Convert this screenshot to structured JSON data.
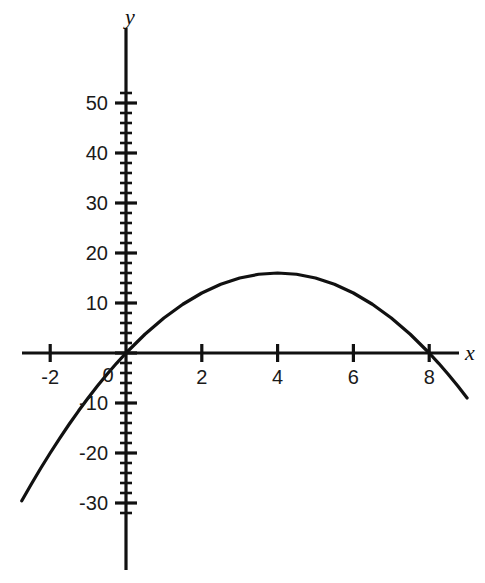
{
  "chart_data": {
    "type": "line",
    "title": "",
    "subtitle": "",
    "xlabel": "x",
    "ylabel": "y",
    "equation": "y = -x^2 + 8x",
    "grid": false,
    "legend": false,
    "xlim": [
      -3.2,
      9.4
    ],
    "ylim": [
      -34,
      53
    ],
    "x_major_ticks": [
      -2,
      0,
      2,
      4,
      6,
      8
    ],
    "x_tick_labels": [
      "-2",
      "0",
      "2",
      "4",
      "6",
      "8"
    ],
    "x_tick_step": 2,
    "x_minor_step": 0,
    "y_major_ticks": [
      -30,
      -20,
      -10,
      0,
      10,
      20,
      30,
      40,
      50
    ],
    "y_tick_labels": [
      "-30",
      "-20",
      "-10",
      "0",
      "10",
      "20",
      "30",
      "40",
      "50"
    ],
    "y_tick_step": 10,
    "y_minor_step": 2,
    "zero_label_shown": "0",
    "roots": [
      0,
      8
    ],
    "vertex": [
      4,
      16
    ],
    "series": [
      {
        "name": "parabola",
        "color": "#111111",
        "x": [
          -2.75,
          -2.5,
          -2.25,
          -2,
          -1.75,
          -1.5,
          -1.25,
          -1,
          -0.75,
          -0.5,
          -0.25,
          0,
          0.5,
          1,
          1.5,
          2,
          2.5,
          3,
          3.5,
          4,
          4.5,
          5,
          5.5,
          6,
          6.5,
          7,
          7.5,
          8,
          8.25,
          8.5,
          8.75,
          9
        ],
        "y": [
          -29.56,
          -26.25,
          -23.06,
          -20,
          -17.06,
          -14.25,
          -11.56,
          -9,
          -6.56,
          -4.25,
          -2.06,
          0,
          3.75,
          7,
          9.75,
          12,
          13.75,
          15,
          15.75,
          16,
          15.75,
          15,
          13.75,
          12,
          9.75,
          7,
          3.75,
          0,
          -2.06,
          -4.25,
          -6.56,
          -9
        ]
      }
    ]
  },
  "axes": {
    "x_axis_name": "x",
    "y_axis_name": "y"
  }
}
